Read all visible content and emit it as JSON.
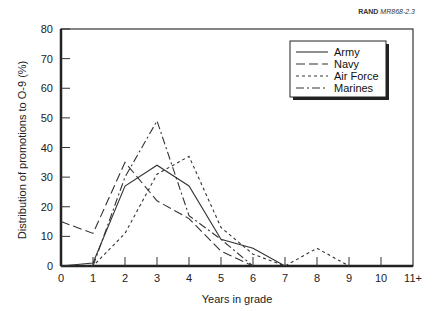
{
  "credit": {
    "org": "RAND",
    "code": "MR868-2.3"
  },
  "chart_data": {
    "type": "line",
    "title": "",
    "xlabel": "Years in grade",
    "ylabel": "Distribution of promotions to O-9 (%)",
    "categories": [
      "0",
      "1",
      "2",
      "3",
      "4",
      "5",
      "6",
      "7",
      "8",
      "9",
      "10",
      "11+"
    ],
    "ylim": [
      0,
      80
    ],
    "yticks": [
      0,
      10,
      20,
      30,
      40,
      50,
      60,
      70,
      80
    ],
    "grid": false,
    "legend_position": "upper right",
    "series": [
      {
        "name": "Army",
        "style": "solid",
        "x": [
          0,
          1,
          2,
          3,
          4,
          5,
          6,
          7
        ],
        "values": [
          0,
          1,
          27,
          34,
          27,
          9,
          6,
          0
        ]
      },
      {
        "name": "Navy",
        "style": "longdash",
        "x": [
          0,
          1,
          2,
          3,
          4,
          5,
          6
        ],
        "values": [
          15,
          11,
          35,
          22,
          16,
          5,
          0
        ]
      },
      {
        "name": "Air Force",
        "style": "shortdash",
        "x": [
          0,
          1,
          2,
          3,
          4,
          5,
          6,
          7,
          8,
          9
        ],
        "values": [
          0,
          0,
          11,
          31,
          37,
          13,
          4,
          0,
          6,
          0
        ]
      },
      {
        "name": "Marines",
        "style": "dashdot",
        "x": [
          1,
          2,
          3,
          4,
          5,
          6
        ],
        "values": [
          0,
          30,
          49,
          17,
          9,
          0
        ]
      }
    ]
  }
}
